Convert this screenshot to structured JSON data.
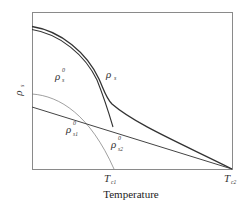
{
  "figure": {
    "y_axis_label": "ρ",
    "y_axis_label_sub": "s",
    "x_axis_label": "Temperature",
    "x_ticks": [
      {
        "main": "T",
        "sub": "c1"
      },
      {
        "main": "T",
        "sub": "c2"
      }
    ],
    "curve_labels": [
      {
        "main": "ρ",
        "sup": "0",
        "sub": "s"
      },
      {
        "main": "ρ",
        "sub": "s"
      },
      {
        "main": "ρ",
        "sup": "0",
        "sub": "s1"
      },
      {
        "main": "ρ",
        "sup": "0",
        "sub": "s2"
      }
    ],
    "colors": {
      "frame": "#7a7a7a",
      "curve": "#333333",
      "dotted": "#666666"
    }
  }
}
